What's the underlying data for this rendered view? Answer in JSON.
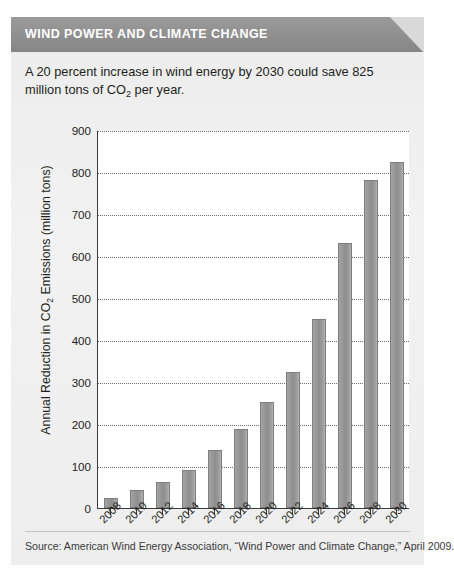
{
  "card": {
    "header_title": "WIND POWER AND CLIMATE CHANGE",
    "deck_line1": "A 20 percent increase in wind energy by 2030 could save 825",
    "deck_line2_pre": "million tons of CO",
    "deck_line2_sub": "2",
    "deck_line2_post": " per year.",
    "source": "Source: American Wind Energy Association, “Wind Power and Climate Change,”  April 2009.",
    "colors": {
      "header_bar": "#8f8f8f",
      "header_fold": "#d9d9d9",
      "card_background": "#f0f0f0",
      "plot_background": "#ffffff",
      "bar_fill": "#9a9a9a",
      "bar_edge": "#7e7e7e",
      "axis": "#3b3b3b",
      "gridline": "#6e6e6e",
      "header_text": "#ffffff",
      "body_text": "#231f20"
    }
  },
  "chart_data": {
    "type": "bar",
    "title": "",
    "xlabel": "",
    "ylabel_pre": "Annual Reduction in CO",
    "ylabel_sub": "2",
    "ylabel_post": " Emissions (million tons)",
    "ylabel": "Annual Reduction in CO2 Emissions (million tons)",
    "categories": [
      "2008",
      "2010",
      "2012",
      "2014",
      "2016",
      "2018",
      "2020",
      "2022",
      "2024",
      "2026",
      "2028",
      "2030"
    ],
    "values": [
      25,
      42,
      62,
      90,
      138,
      188,
      253,
      325,
      450,
      630,
      780,
      825
    ],
    "ylim": [
      0,
      900
    ],
    "yticks": [
      0,
      100,
      200,
      300,
      400,
      500,
      600,
      700,
      800,
      900
    ],
    "ytick_labels": [
      "0",
      "100",
      "200",
      "300",
      "400",
      "500",
      "600",
      "700",
      "800",
      "900"
    ],
    "grid": true,
    "grid_axis": "y",
    "grid_style": "dotted",
    "legend": false,
    "legend_position": "none",
    "xtick_rotation": -45,
    "series": [
      {
        "name": "Annual Reduction in CO2 Emissions",
        "values": [
          25,
          42,
          62,
          90,
          138,
          188,
          253,
          325,
          450,
          630,
          780,
          825
        ]
      }
    ]
  }
}
